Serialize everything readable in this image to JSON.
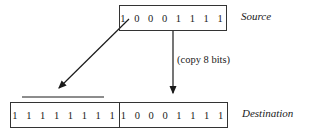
{
  "source": {
    "bits": "10001111",
    "bits_display": "1 0 0 0 1 1 1 1",
    "label": "Source"
  },
  "destination": {
    "high_bits": "11111111",
    "high_display": "1 1 1 1 1 1 1 1",
    "low_bits": "10001111",
    "low_display": "1 0 0 0 1 1 1 1",
    "label": "Destination"
  },
  "annotation": "(copy 8 bits)"
}
